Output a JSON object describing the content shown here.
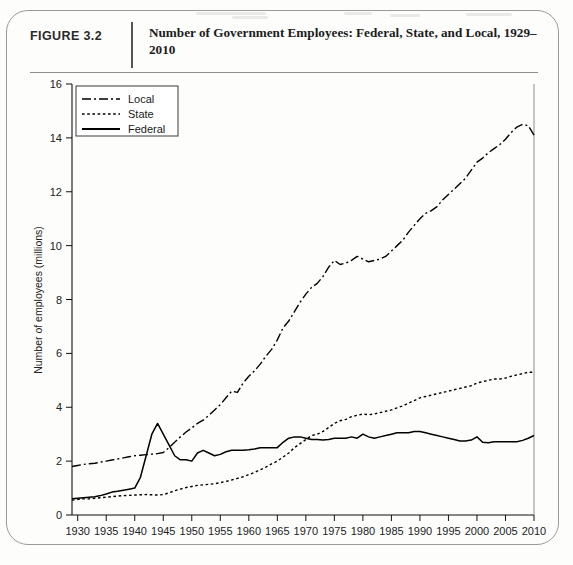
{
  "figure": {
    "label": "FIGURE 3.2",
    "title": "Number of Government Employees: Federal, State, and Local, 1929–2010"
  },
  "chart_data": {
    "type": "line",
    "title": "Number of Government Employees: Federal, State, and Local, 1929–2010",
    "xlabel": "",
    "ylabel": "Number of employees (millions)",
    "xlim": [
      1929,
      2010
    ],
    "ylim": [
      0,
      16
    ],
    "ytick_step": 2,
    "yticks": [
      "0",
      "2",
      "4",
      "6",
      "8",
      "10",
      "12",
      "14",
      "16"
    ],
    "xticks": [
      "1930",
      "1935",
      "1940",
      "1945",
      "1950",
      "1955",
      "1960",
      "1965",
      "1970",
      "1975",
      "1980",
      "1985",
      "1990",
      "1995",
      "2000",
      "2005",
      "2010"
    ],
    "grid": false,
    "legend_position": "top-left",
    "line_color": "#000000",
    "x": [
      1929,
      1930,
      1931,
      1932,
      1933,
      1934,
      1935,
      1936,
      1937,
      1938,
      1939,
      1940,
      1941,
      1942,
      1943,
      1944,
      1945,
      1946,
      1947,
      1948,
      1949,
      1950,
      1951,
      1952,
      1953,
      1954,
      1955,
      1956,
      1957,
      1958,
      1959,
      1960,
      1961,
      1962,
      1963,
      1964,
      1965,
      1966,
      1967,
      1968,
      1969,
      1970,
      1971,
      1972,
      1973,
      1974,
      1975,
      1976,
      1977,
      1978,
      1979,
      1980,
      1981,
      1982,
      1983,
      1984,
      1985,
      1986,
      1987,
      1988,
      1989,
      1990,
      1991,
      1992,
      1993,
      1994,
      1995,
      1996,
      1997,
      1998,
      1999,
      2000,
      2001,
      2002,
      2003,
      2004,
      2005,
      2006,
      2007,
      2008,
      2009,
      2010
    ],
    "series": [
      {
        "name": "Local",
        "style": "dash-dot",
        "values": [
          1.8,
          1.84,
          1.88,
          1.9,
          1.92,
          1.96,
          2.0,
          2.04,
          2.08,
          2.12,
          2.16,
          2.2,
          2.22,
          2.24,
          2.26,
          2.28,
          2.32,
          2.5,
          2.7,
          2.9,
          3.08,
          3.23,
          3.4,
          3.52,
          3.7,
          3.9,
          4.1,
          4.35,
          4.6,
          4.55,
          4.9,
          5.15,
          5.35,
          5.6,
          5.9,
          6.15,
          6.5,
          6.95,
          7.2,
          7.55,
          7.9,
          8.2,
          8.45,
          8.6,
          8.85,
          9.2,
          9.45,
          9.3,
          9.35,
          9.45,
          9.6,
          9.5,
          9.4,
          9.45,
          9.5,
          9.6,
          9.8,
          10.0,
          10.2,
          10.5,
          10.75,
          11.0,
          11.2,
          11.3,
          11.45,
          11.7,
          11.9,
          12.1,
          12.3,
          12.5,
          12.8,
          13.1,
          13.25,
          13.45,
          13.6,
          13.75,
          13.95,
          14.2,
          14.4,
          14.5,
          14.45,
          14.1
        ]
      },
      {
        "name": "State",
        "style": "dotted",
        "values": [
          0.55,
          0.58,
          0.6,
          0.6,
          0.62,
          0.64,
          0.66,
          0.68,
          0.7,
          0.72,
          0.73,
          0.74,
          0.75,
          0.76,
          0.75,
          0.74,
          0.76,
          0.82,
          0.9,
          0.96,
          1.02,
          1.06,
          1.1,
          1.12,
          1.14,
          1.16,
          1.2,
          1.25,
          1.3,
          1.36,
          1.42,
          1.5,
          1.58,
          1.68,
          1.78,
          1.9,
          2.0,
          2.15,
          2.3,
          2.5,
          2.65,
          2.8,
          2.95,
          3.0,
          3.1,
          3.25,
          3.4,
          3.5,
          3.55,
          3.65,
          3.7,
          3.75,
          3.72,
          3.75,
          3.8,
          3.85,
          3.9,
          3.98,
          4.05,
          4.15,
          4.25,
          4.35,
          4.4,
          4.45,
          4.5,
          4.55,
          4.6,
          4.65,
          4.7,
          4.75,
          4.8,
          4.9,
          4.95,
          5.0,
          5.05,
          5.05,
          5.08,
          5.15,
          5.2,
          5.25,
          5.3,
          5.3
        ]
      },
      {
        "name": "Federal",
        "style": "solid",
        "values": [
          0.6,
          0.62,
          0.64,
          0.66,
          0.68,
          0.72,
          0.78,
          0.85,
          0.88,
          0.92,
          0.96,
          1.0,
          1.4,
          2.2,
          3.0,
          3.4,
          3.0,
          2.6,
          2.2,
          2.05,
          2.05,
          2.0,
          2.3,
          2.4,
          2.3,
          2.2,
          2.25,
          2.35,
          2.4,
          2.4,
          2.4,
          2.42,
          2.45,
          2.5,
          2.5,
          2.5,
          2.5,
          2.7,
          2.85,
          2.9,
          2.9,
          2.85,
          2.8,
          2.8,
          2.78,
          2.8,
          2.85,
          2.85,
          2.85,
          2.9,
          2.85,
          3.0,
          2.9,
          2.85,
          2.9,
          2.95,
          3.0,
          3.05,
          3.05,
          3.05,
          3.1,
          3.1,
          3.05,
          3.0,
          2.95,
          2.9,
          2.85,
          2.8,
          2.75,
          2.75,
          2.78,
          2.9,
          2.7,
          2.68,
          2.72,
          2.72,
          2.72,
          2.72,
          2.72,
          2.77,
          2.85,
          2.95
        ]
      }
    ]
  },
  "axes": {
    "y_title": "Number of employees (millions)"
  },
  "legend": {
    "items": [
      {
        "label": "Local",
        "style": "dash-dot"
      },
      {
        "label": "State",
        "style": "dotted"
      },
      {
        "label": "Federal",
        "style": "solid"
      }
    ]
  }
}
